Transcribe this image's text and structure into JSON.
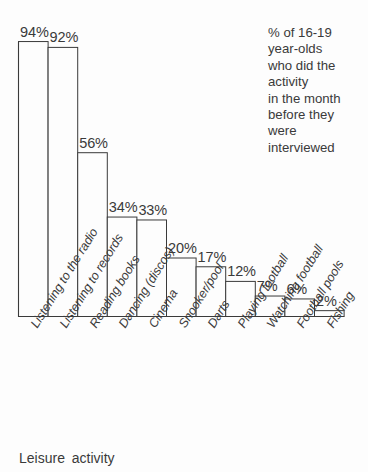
{
  "chart_data": {
    "type": "bar",
    "title": "",
    "subtitle": "",
    "xlabel": "Leisure activity",
    "ylabel": "",
    "ylim": [
      0,
      100
    ],
    "grid": false,
    "legend": "none",
    "orientation": "vertical",
    "value_suffix": "%",
    "categories": [
      "Listening to the radio",
      "Listening to records",
      "Reading books",
      "Dancing (discos)",
      "Cinema",
      "Snooker/pool",
      "Darts",
      "Playing football",
      "Watching football",
      "Football pools",
      "Fishing"
    ],
    "values": [
      94,
      92,
      56,
      34,
      33,
      20,
      17,
      12,
      7,
      6,
      2
    ],
    "value_labels": [
      "94%",
      "92%",
      "56%",
      "34%",
      "33%",
      "20%",
      "17%",
      "12%",
      "7%",
      "6%",
      "2%"
    ],
    "annotation_lines": [
      "% of 16-19",
      "year-olds",
      "who did the",
      "activity",
      "in the month",
      "before they",
      "were",
      "interviewed"
    ],
    "colors": {
      "bar_fill": "#fdfdfd",
      "bar_stroke": "#3a3a3a",
      "axis": "#3a3a3a",
      "text": "#3a3a3a",
      "background": "#fdfdfd"
    }
  }
}
